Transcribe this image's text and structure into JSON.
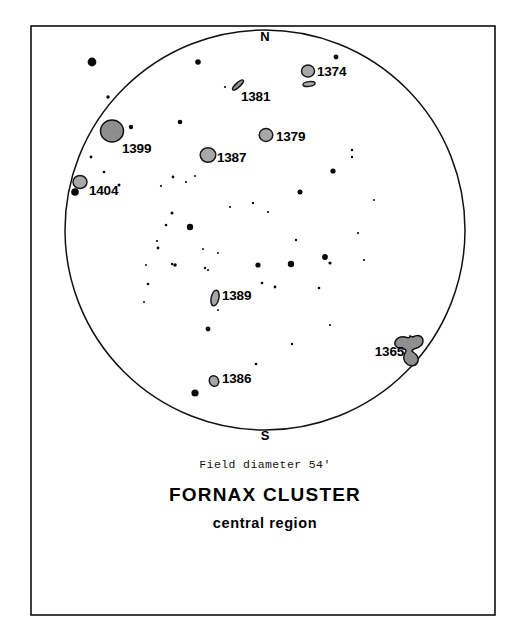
{
  "figure": {
    "title": "FORNAX CLUSTER",
    "subtitle": "central region",
    "field_note": "Field diameter 54'",
    "cardinal_north": "N",
    "cardinal_south": "S",
    "frame_color": "#101010",
    "circle_color": "#121212",
    "galaxy_fill": "#a8a8a8",
    "star_color": "#0a0a0a",
    "background": "#ffffff"
  },
  "chart_data": {
    "type": "scatter",
    "title": "FORNAX CLUSTER",
    "subtitle": "central region",
    "xlabel": "",
    "ylabel": "",
    "grid": false,
    "legend": false,
    "annotations": [
      "Field diameter 54'",
      "N",
      "S"
    ],
    "field": {
      "shape": "circle",
      "diameter_arcmin": 54,
      "center_px": [
        265,
        230
      ],
      "radius_px": 200,
      "north_at": "top",
      "south_at": "bottom"
    },
    "galaxies": [
      {
        "name": "1374",
        "x": 308,
        "y": 71,
        "glyph": "circle",
        "rx": 6.5,
        "ry": 6.0,
        "rot": 0,
        "label_x": 317,
        "label_y": 76,
        "label_anchor": "start"
      },
      {
        "name": "1375",
        "x": 309,
        "y": 84,
        "glyph": "ellipse-flat",
        "rx": 6.0,
        "ry": 2.4,
        "rot": -8,
        "label_x": null,
        "label_y": null,
        "label_anchor": null
      },
      {
        "name": "1381",
        "x": 238,
        "y": 85,
        "glyph": "sliver",
        "rx": 7.0,
        "ry": 2.2,
        "rot": -42,
        "label_x": 241,
        "label_y": 101,
        "label_anchor": "start"
      },
      {
        "name": "1379",
        "x": 266,
        "y": 135,
        "glyph": "circle",
        "rx": 6.8,
        "ry": 6.4,
        "rot": 0,
        "label_x": 276,
        "label_y": 141,
        "label_anchor": "start"
      },
      {
        "name": "1399",
        "x": 112,
        "y": 131,
        "glyph": "circle-big",
        "rx": 11.5,
        "ry": 11.0,
        "rot": 0,
        "label_x": 122,
        "label_y": 153,
        "label_anchor": "start"
      },
      {
        "name": "1387",
        "x": 208,
        "y": 155,
        "glyph": "circle",
        "rx": 7.8,
        "ry": 7.2,
        "rot": 0,
        "label_x": 217,
        "label_y": 162,
        "label_anchor": "start"
      },
      {
        "name": "1404",
        "x": 80,
        "y": 182,
        "glyph": "circle",
        "rx": 7.0,
        "ry": 6.5,
        "rot": 0,
        "label_x": 89,
        "label_y": 195,
        "label_anchor": "start"
      },
      {
        "name": "1389",
        "x": 215,
        "y": 298,
        "glyph": "ellipse-tall",
        "rx": 3.8,
        "ry": 8.0,
        "rot": 12,
        "label_x": 222,
        "label_y": 300,
        "label_anchor": "start"
      },
      {
        "name": "1386",
        "x": 214,
        "y": 381,
        "glyph": "ellipse-small",
        "rx": 4.6,
        "ry": 5.4,
        "rot": -25,
        "label_x": 222,
        "label_y": 383,
        "label_anchor": "start"
      },
      {
        "name": "1365",
        "x": 415,
        "y": 348,
        "glyph": "barred-spiral",
        "rx": 15,
        "ry": 15,
        "rot": 0,
        "label_x": 404,
        "label_y": 356,
        "label_anchor": "end"
      }
    ],
    "field_stars": [
      {
        "x": 92,
        "y": 62,
        "r": 4.4
      },
      {
        "x": 198,
        "y": 62,
        "r": 2.8
      },
      {
        "x": 336,
        "y": 57,
        "r": 2.4
      },
      {
        "x": 108,
        "y": 97,
        "r": 1.7
      },
      {
        "x": 225,
        "y": 87,
        "r": 1.1
      },
      {
        "x": 131,
        "y": 127,
        "r": 2.2
      },
      {
        "x": 91,
        "y": 157,
        "r": 1.4
      },
      {
        "x": 75,
        "y": 192,
        "r": 3.8
      },
      {
        "x": 104,
        "y": 172,
        "r": 1.3
      },
      {
        "x": 119,
        "y": 185,
        "r": 1.5
      },
      {
        "x": 180,
        "y": 122,
        "r": 2.3
      },
      {
        "x": 352,
        "y": 150,
        "r": 1.2
      },
      {
        "x": 352,
        "y": 157,
        "r": 1.2
      },
      {
        "x": 333,
        "y": 171,
        "r": 2.6
      },
      {
        "x": 300,
        "y": 192,
        "r": 2.5
      },
      {
        "x": 253,
        "y": 203,
        "r": 1.2
      },
      {
        "x": 173,
        "y": 177,
        "r": 1.4
      },
      {
        "x": 186,
        "y": 182,
        "r": 1.1
      },
      {
        "x": 195,
        "y": 176,
        "r": 1.0
      },
      {
        "x": 172,
        "y": 213,
        "r": 1.5
      },
      {
        "x": 166,
        "y": 225,
        "r": 1.3
      },
      {
        "x": 190,
        "y": 227,
        "r": 3.2
      },
      {
        "x": 158,
        "y": 248,
        "r": 1.4
      },
      {
        "x": 175,
        "y": 265,
        "r": 1.8
      },
      {
        "x": 230,
        "y": 207,
        "r": 1.1
      },
      {
        "x": 268,
        "y": 212,
        "r": 1.1
      },
      {
        "x": 296,
        "y": 240,
        "r": 1.2
      },
      {
        "x": 364,
        "y": 260,
        "r": 1.1
      },
      {
        "x": 325,
        "y": 257,
        "r": 2.9
      },
      {
        "x": 330,
        "y": 263,
        "r": 1.6
      },
      {
        "x": 203,
        "y": 249,
        "r": 1.0
      },
      {
        "x": 218,
        "y": 253,
        "r": 1.0
      },
      {
        "x": 148,
        "y": 284,
        "r": 1.3
      },
      {
        "x": 172,
        "y": 264,
        "r": 1.2
      },
      {
        "x": 291,
        "y": 264,
        "r": 3.2
      },
      {
        "x": 258,
        "y": 265,
        "r": 2.6
      },
      {
        "x": 262,
        "y": 283,
        "r": 1.3
      },
      {
        "x": 275,
        "y": 287,
        "r": 1.4
      },
      {
        "x": 319,
        "y": 288,
        "r": 1.3
      },
      {
        "x": 146,
        "y": 265,
        "r": 1.0
      },
      {
        "x": 205,
        "y": 268,
        "r": 1.2
      },
      {
        "x": 208,
        "y": 270,
        "r": 1.1
      },
      {
        "x": 208,
        "y": 329,
        "r": 2.4
      },
      {
        "x": 292,
        "y": 344,
        "r": 1.2
      },
      {
        "x": 256,
        "y": 364,
        "r": 1.3
      },
      {
        "x": 195,
        "y": 393,
        "r": 3.6
      },
      {
        "x": 330,
        "y": 325,
        "r": 1.1
      },
      {
        "x": 144,
        "y": 302,
        "r": 1.0
      },
      {
        "x": 358,
        "y": 233,
        "r": 1.1
      },
      {
        "x": 374,
        "y": 200,
        "r": 1.0
      },
      {
        "x": 218,
        "y": 310,
        "r": 1.0
      },
      {
        "x": 157,
        "y": 241,
        "r": 1.1
      },
      {
        "x": 161,
        "y": 186,
        "r": 1.1
      }
    ]
  }
}
